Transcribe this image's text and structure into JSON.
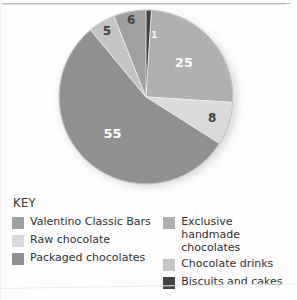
{
  "figure": {
    "key_title": "KEY"
  },
  "chart_data": {
    "type": "pie",
    "title": "",
    "categories": [
      "Biscuits and cakes",
      "Exclusive handmade chocolates",
      "Raw chocolate",
      "Packaged chocolates",
      "Chocolate drinks",
      "Valentino Classic Bars"
    ],
    "values": [
      1,
      25,
      8,
      55,
      5,
      6
    ],
    "labels": [
      "1",
      "25",
      "8",
      "55",
      "5",
      "6"
    ],
    "colors": [
      "#3c3c3c",
      "#aeaeae",
      "#d9d9d9",
      "#8c8c8c",
      "#c2c2c2",
      "#9d9d9d"
    ],
    "units": "%",
    "total": 100,
    "start_angle_deg": 0,
    "direction": "clockwise",
    "legend_position": "bottom",
    "grid": false,
    "slices": [
      {
        "label": "1",
        "value": 1,
        "category": "Biscuits and cakes",
        "color": "#3c3c3c",
        "label_color": "light"
      },
      {
        "label": "25",
        "value": 25,
        "category": "Exclusive handmade chocolates",
        "color": "#aeaeae",
        "label_color": "light"
      },
      {
        "label": "8",
        "value": 8,
        "category": "Raw chocolate",
        "color": "#d9d9d9",
        "label_color": "dark"
      },
      {
        "label": "55",
        "value": 55,
        "category": "Packaged chocolates",
        "color": "#8c8c8c",
        "label_color": "light"
      },
      {
        "label": "5",
        "value": 5,
        "category": "Chocolate drinks",
        "color": "#c2c2c2",
        "label_color": "dark"
      },
      {
        "label": "6",
        "value": 6,
        "category": "Valentino Classic Bars",
        "color": "#9d9d9d",
        "label_color": "dark"
      }
    ]
  },
  "legend": {
    "title": "KEY",
    "left_column": [
      {
        "label": "Valentino Classic Bars",
        "color": "#9d9d9d"
      },
      {
        "label": "Raw chocolate",
        "color": "#d9d9d9"
      },
      {
        "label": "Packaged chocolates",
        "color": "#8c8c8c"
      }
    ],
    "right_column": [
      {
        "label": "Exclusive handmade chocolates",
        "color": "#aeaeae"
      },
      {
        "label": "Chocolate drinks",
        "color": "#c2c2c2"
      },
      {
        "label": "Biscuits and cakes",
        "color": "#3c3c3c"
      }
    ]
  }
}
